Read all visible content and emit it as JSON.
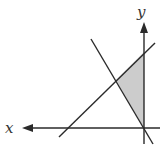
{
  "diagram": {
    "type": "linear-inequality-region",
    "axes": {
      "x_label": "x",
      "y_label": "y",
      "x_arrow_direction": "left",
      "y_arrow_direction": "up"
    },
    "lines": [
      {
        "name": "positive-slope-line",
        "from": [
          59,
          137
        ],
        "to": [
          155,
          43
        ]
      },
      {
        "name": "negative-slope-line",
        "from": [
          91,
          39
        ],
        "to": [
          153,
          144
        ]
      }
    ],
    "shaded_region": {
      "vertices": [
        [
          116,
          80
        ],
        [
          144,
          52
        ],
        [
          144,
          128
        ]
      ],
      "fill": "#cccccc"
    },
    "colors": {
      "line": "#2a2a2a",
      "axis": "#2a2a2a",
      "shade": "#cccccc",
      "background": "#ffffff"
    }
  }
}
